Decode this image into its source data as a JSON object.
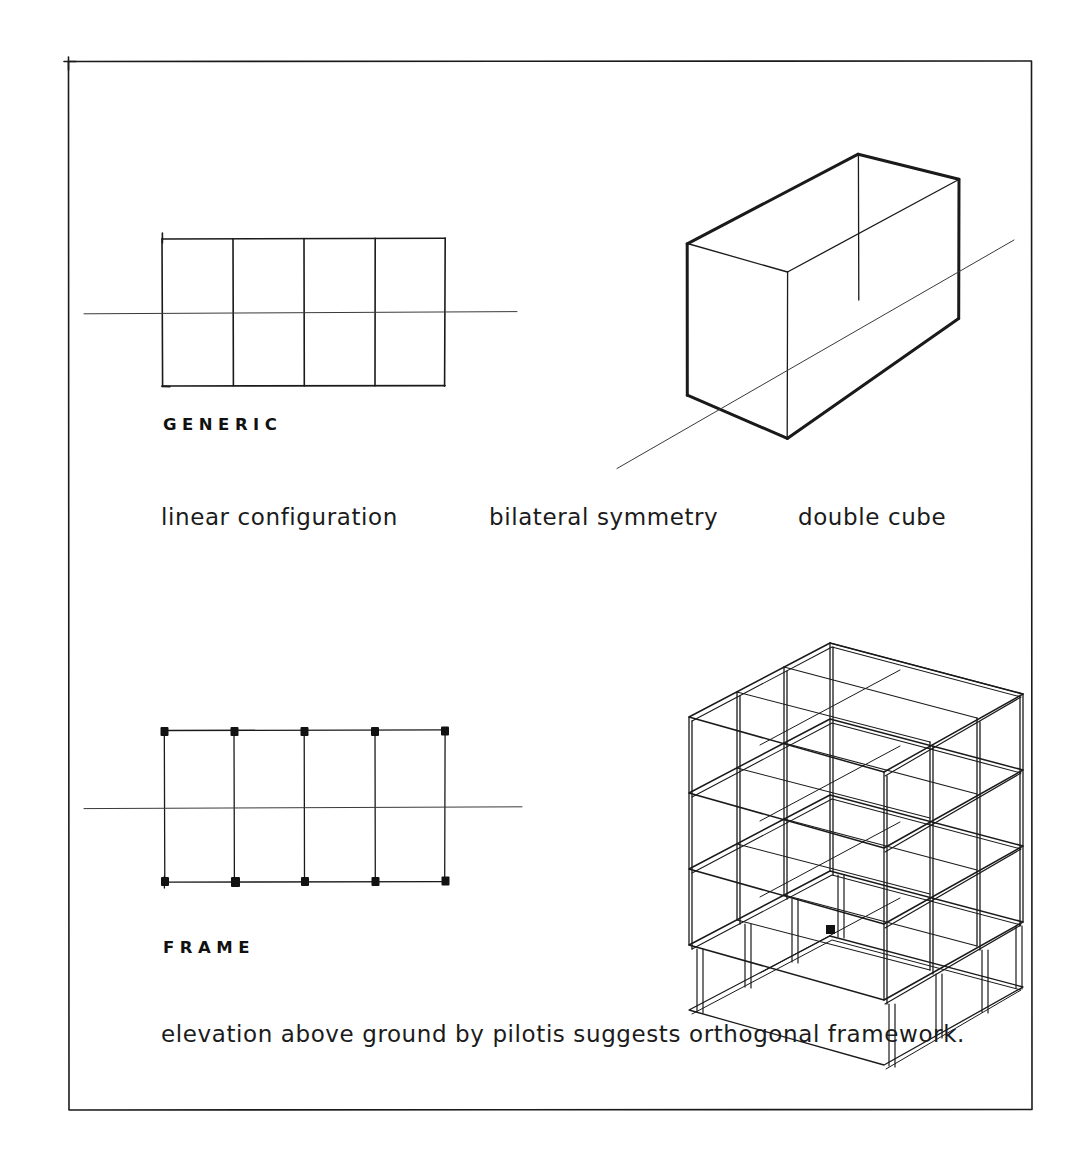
{
  "sheet": {
    "background_color": "#ffffff",
    "ink_color": "#1a1a1a",
    "border": {
      "name": "sheet-border",
      "x": 68,
      "y": 61,
      "width": 964,
      "height": 1049,
      "stroke_width": 1.6
    }
  },
  "sections": [
    {
      "id": "generic",
      "heading": "GENERIC",
      "heading_pos": {
        "x": 163,
        "y": 425
      },
      "caption_pos": {
        "x": 161,
        "y": 505
      },
      "caption_segments": [
        {
          "text": "linear configuration",
          "x": 161
        },
        {
          "text": "bilateral symmetry",
          "x": 489
        },
        {
          "text": "double cube",
          "x": 798
        }
      ],
      "caption_full": "linear configuration    bilateral symmetry    double cube"
    },
    {
      "id": "frame",
      "heading": "FRAME",
      "heading_pos": {
        "x": 163,
        "y": 948
      },
      "caption_pos": {
        "x": 161,
        "y": 1022
      },
      "caption_segments": [
        {
          "text": "elevation above ground by pilotis suggests orthogonal framework.",
          "x": 161
        }
      ],
      "caption_full": "elevation above ground by pilotis suggests orthogonal framework."
    }
  ],
  "drawings": {
    "generic_plan": {
      "name": "generic-plan-diagram",
      "type": "plan-grid",
      "description": "rectangle divided into four equal bays with a horizontal symmetry axis",
      "rect": {
        "x": 162,
        "y": 238,
        "width": 283,
        "height": 148
      },
      "bays": 4,
      "bay_divider_x": [
        233,
        304,
        375
      ],
      "axis": {
        "y": 313,
        "x_start": 84,
        "x_end": 517
      },
      "stroke_width": 1.7,
      "axis_stroke_width": 1.0
    },
    "generic_axon": {
      "name": "double-cube-axonometric",
      "type": "axonometric-box",
      "description": "wireframe double-cube volume with a diagonal axis line passing through",
      "vertices": {
        "top_back_left": [
          687,
          243
        ],
        "top_back_right": [
          858,
          154
        ],
        "top_front_right": [
          959,
          179
        ],
        "top_front_left": [
          787,
          272
        ],
        "bottom_back_left": [
          687,
          395
        ],
        "bottom_front_left": [
          787,
          438
        ],
        "bottom_front_right": [
          959,
          318
        ]
      },
      "axis": {
        "x_start": 617,
        "y_start": 468,
        "x_end": 1014,
        "y_end": 240
      },
      "stroke_width_outer": 3.0,
      "stroke_width_inner": 1.4,
      "axis_stroke_width": 1.0
    },
    "frame_plan": {
      "name": "frame-plan-diagram",
      "type": "plan-grid-with-columns",
      "description": "four-bay grid with solid square column markers at ten intersections",
      "rect": {
        "x": 164,
        "y": 730,
        "width": 281,
        "height": 152
      },
      "bays": 4,
      "bay_divider_x": [
        234,
        304,
        375
      ],
      "axis": {
        "y": 808,
        "x_start": 84,
        "x_end": 522
      },
      "column_marker_size": 8,
      "column_x": [
        164,
        234,
        304,
        375,
        445
      ],
      "column_y": [
        730,
        882
      ],
      "stroke_width": 1.3,
      "axis_stroke_width": 1.0
    },
    "frame_axon": {
      "name": "frame-axonometric",
      "type": "axonometric-skeleton-frame",
      "description": "four-level orthogonal structural frame raised on pilotis, four bays long and one bay deep",
      "levels": 4,
      "bays_long": 4,
      "bays_deep": 1,
      "pilotis": true,
      "stroke_width": 1.6
    }
  }
}
